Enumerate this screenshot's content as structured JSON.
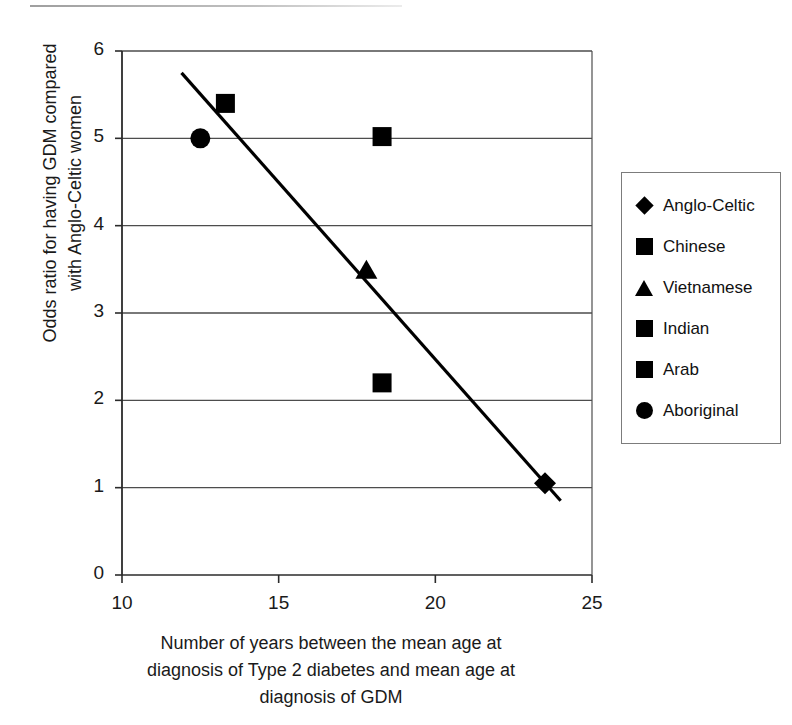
{
  "chart_data": {
    "type": "scatter",
    "title": "",
    "xlabel": "Number of years between the mean age at diagnosis of Type 2 diabetes and mean age at diagnosis of GDM",
    "ylabel": "Odds ratio for having GDM compared with Anglo-Celtic women",
    "xlim": [
      10,
      25
    ],
    "ylim": [
      0,
      6
    ],
    "xticks": [
      "10",
      "15",
      "20",
      "25"
    ],
    "xtick_values": [
      10,
      15,
      20,
      25
    ],
    "yticks": [
      "0",
      "1",
      "2",
      "3",
      "4",
      "5",
      "6"
    ],
    "ytick_values": [
      0,
      1,
      2,
      3,
      4,
      5,
      6
    ],
    "grid": "horizontal",
    "legend_position": "right",
    "points": [
      {
        "label": "Anglo-Celtic",
        "marker": "diamond",
        "x": 23.5,
        "y": 1.05
      },
      {
        "label": "Chinese",
        "marker": "square",
        "x": 13.3,
        "y": 5.4
      },
      {
        "label": "Vietnamese",
        "marker": "triangle",
        "x": 17.8,
        "y": 3.5
      },
      {
        "label": "Indian",
        "marker": "square",
        "x": 18.3,
        "y": 5.02
      },
      {
        "label": "Arab",
        "marker": "square",
        "x": 18.3,
        "y": 2.2
      },
      {
        "label": "Aboriginal",
        "marker": "circle",
        "x": 12.5,
        "y": 5.0
      }
    ],
    "trendline": {
      "x1": 11.9,
      "y1": 5.75,
      "x2": 24.0,
      "y2": 0.85
    }
  },
  "axis": {
    "ylabel_line1": "Odds ratio for having GDM compared",
    "ylabel_line2": "with Anglo-Celtic women",
    "xlabel_line1": "Number of years between the mean age at",
    "xlabel_line2": "diagnosis of Type 2 diabetes and mean age at",
    "xlabel_line3": "diagnosis of GDM"
  },
  "legend": {
    "items": [
      {
        "label": "Anglo-Celtic",
        "marker": "diamond"
      },
      {
        "label": "Chinese",
        "marker": "square"
      },
      {
        "label": "Vietnamese",
        "marker": "triangle"
      },
      {
        "label": "Indian",
        "marker": "square"
      },
      {
        "label": "Arab",
        "marker": "square"
      },
      {
        "label": "Aboriginal",
        "marker": "circle"
      }
    ]
  },
  "colors": {
    "marker": "#000000",
    "gridline": "#4d4d4d",
    "axis": "#2b2b2b",
    "legend_border": "#7c7c7c"
  }
}
